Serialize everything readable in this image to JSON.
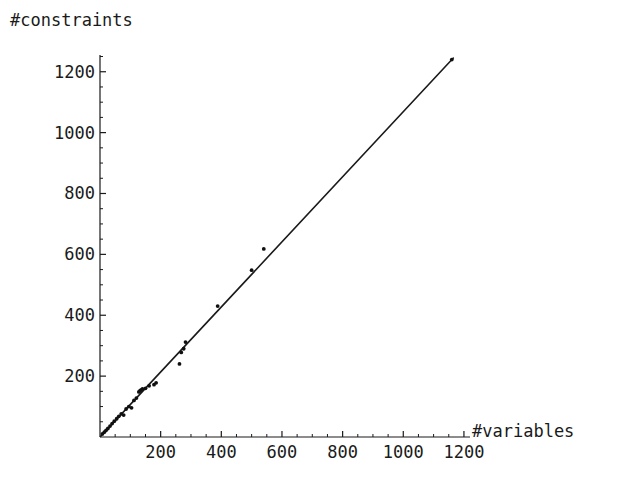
{
  "chart_data": {
    "type": "scatter",
    "title": "",
    "xlabel": "#variables",
    "ylabel": "#constraints",
    "xlim": [
      0,
      1220
    ],
    "ylim": [
      0,
      1255
    ],
    "grid": false,
    "legend": null,
    "xticks": [
      200,
      400,
      600,
      800,
      1000,
      1200
    ],
    "xtick_labels": [
      "200",
      "400",
      "600",
      "800",
      "1000",
      "1200"
    ],
    "yticks": [
      200,
      400,
      600,
      800,
      1000,
      1200
    ],
    "ytick_labels": [
      "200",
      "400",
      "600",
      "800",
      "1000",
      "1200"
    ],
    "minor_tick_step": 50,
    "series": [
      {
        "name": "reference line",
        "type": "line",
        "color": "#1a1a1a",
        "x": [
          2,
          1165
        ],
        "y": [
          2,
          1245
        ]
      },
      {
        "name": "instances",
        "type": "scatter",
        "marker": "dot",
        "color": "#101010",
        "points": [
          [
            8,
            10
          ],
          [
            14,
            16
          ],
          [
            20,
            22
          ],
          [
            26,
            28
          ],
          [
            33,
            36
          ],
          [
            40,
            44
          ],
          [
            47,
            52
          ],
          [
            55,
            60
          ],
          [
            62,
            68
          ],
          [
            70,
            76
          ],
          [
            78,
            72
          ],
          [
            86,
            92
          ],
          [
            95,
            100
          ],
          [
            104,
            96
          ],
          [
            112,
            120
          ],
          [
            120,
            128
          ],
          [
            128,
            148
          ],
          [
            132,
            152
          ],
          [
            136,
            155
          ],
          [
            140,
            158
          ],
          [
            150,
            160
          ],
          [
            162,
            168
          ],
          [
            178,
            172
          ],
          [
            185,
            178
          ],
          [
            262,
            240
          ],
          [
            268,
            278
          ],
          [
            276,
            290
          ],
          [
            282,
            312
          ],
          [
            388,
            430
          ],
          [
            500,
            548
          ],
          [
            540,
            618
          ],
          [
            1160,
            1240
          ]
        ]
      }
    ]
  },
  "axes": {
    "y_axis_name": "constraints-axis",
    "x_axis_name": "variables-axis"
  }
}
